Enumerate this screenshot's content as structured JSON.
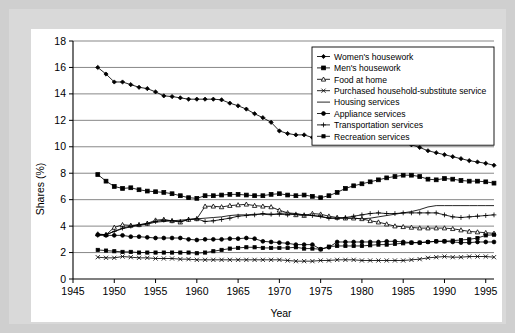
{
  "figure": {
    "background_color": "#cfcfcf",
    "mat_color": "#d9d9d9",
    "panel_color": "#ffffff"
  },
  "chart_data": {
    "type": "line",
    "title": "",
    "xlabel": "Year",
    "ylabel": "Shares (%)",
    "xlim": [
      1945,
      1996
    ],
    "ylim": [
      0,
      18
    ],
    "xticks": [
      1945,
      1950,
      1955,
      1960,
      1965,
      1970,
      1975,
      1980,
      1985,
      1990,
      1995
    ],
    "yticks": [
      0,
      2,
      4,
      6,
      8,
      10,
      12,
      14,
      16,
      18
    ],
    "grid": "horizontal",
    "legend_position": "top-right",
    "line_color": "#000000",
    "x": [
      1948,
      1949,
      1950,
      1951,
      1952,
      1953,
      1954,
      1955,
      1956,
      1957,
      1958,
      1959,
      1960,
      1961,
      1962,
      1963,
      1964,
      1965,
      1966,
      1967,
      1968,
      1969,
      1970,
      1971,
      1972,
      1973,
      1974,
      1975,
      1976,
      1977,
      1978,
      1979,
      1980,
      1981,
      1982,
      1983,
      1984,
      1985,
      1986,
      1987,
      1988,
      1989,
      1990,
      1991,
      1992,
      1993,
      1994,
      1995,
      1996
    ],
    "series": [
      {
        "name": "Women's housework",
        "marker": "filled-diamond",
        "values": [
          16.0,
          15.5,
          14.9,
          14.9,
          14.7,
          14.5,
          14.4,
          14.15,
          13.85,
          13.8,
          13.7,
          13.6,
          13.6,
          13.6,
          13.6,
          13.55,
          13.3,
          13.1,
          12.85,
          12.5,
          12.2,
          11.85,
          11.2,
          11.0,
          10.9,
          10.9,
          10.7,
          10.55,
          10.5,
          10.55,
          10.6,
          10.75,
          10.8,
          10.8,
          10.75,
          10.6,
          10.45,
          10.3,
          10.15,
          9.95,
          9.7,
          9.55,
          9.4,
          9.25,
          9.1,
          8.95,
          8.85,
          8.75,
          8.6
        ]
      },
      {
        "name": "Men's housework",
        "marker": "filled-square",
        "values": [
          7.9,
          7.4,
          7.0,
          6.85,
          6.9,
          6.75,
          6.65,
          6.6,
          6.55,
          6.45,
          6.3,
          6.15,
          6.1,
          6.3,
          6.3,
          6.35,
          6.4,
          6.4,
          6.35,
          6.3,
          6.3,
          6.4,
          6.45,
          6.35,
          6.3,
          6.35,
          6.25,
          6.15,
          6.3,
          6.55,
          6.85,
          7.05,
          7.2,
          7.35,
          7.5,
          7.65,
          7.75,
          7.85,
          7.85,
          7.75,
          7.55,
          7.5,
          7.6,
          7.55,
          7.45,
          7.4,
          7.4,
          7.35,
          7.25
        ]
      },
      {
        "name": "Food at home",
        "marker": "open-triangle",
        "values": [
          3.4,
          3.35,
          3.9,
          4.1,
          4.05,
          4.1,
          4.2,
          4.45,
          4.5,
          4.4,
          4.3,
          4.5,
          4.55,
          5.5,
          5.5,
          5.45,
          5.55,
          5.6,
          5.65,
          5.55,
          5.5,
          5.45,
          5.2,
          5.0,
          4.85,
          4.8,
          4.95,
          4.9,
          4.75,
          4.65,
          4.6,
          4.6,
          4.55,
          4.4,
          4.3,
          4.15,
          4.0,
          3.95,
          3.9,
          3.85,
          3.85,
          3.85,
          3.85,
          3.8,
          3.7,
          3.6,
          3.55,
          3.5,
          3.45
        ]
      },
      {
        "name": "Purchased household-substitute service",
        "marker": "cross-x",
        "values": [
          1.65,
          1.6,
          1.6,
          1.7,
          1.65,
          1.6,
          1.6,
          1.55,
          1.55,
          1.55,
          1.5,
          1.5,
          1.45,
          1.45,
          1.45,
          1.45,
          1.45,
          1.45,
          1.45,
          1.45,
          1.45,
          1.45,
          1.45,
          1.4,
          1.35,
          1.35,
          1.35,
          1.4,
          1.4,
          1.45,
          1.45,
          1.45,
          1.4,
          1.4,
          1.4,
          1.4,
          1.4,
          1.4,
          1.45,
          1.5,
          1.6,
          1.65,
          1.7,
          1.65,
          1.65,
          1.7,
          1.7,
          1.7,
          1.65
        ]
      },
      {
        "name": "Housing services",
        "marker": "line-only",
        "values": [
          3.35,
          3.35,
          3.6,
          3.8,
          3.95,
          4.05,
          4.15,
          4.3,
          4.35,
          4.4,
          4.45,
          4.5,
          4.55,
          4.6,
          4.65,
          4.7,
          4.8,
          4.85,
          4.85,
          4.9,
          4.9,
          4.85,
          4.95,
          5.0,
          4.95,
          4.85,
          4.8,
          4.7,
          4.6,
          4.6,
          4.6,
          4.6,
          4.55,
          4.6,
          4.7,
          4.8,
          4.9,
          5.0,
          5.1,
          5.25,
          5.45,
          5.55,
          5.55,
          5.55,
          5.55,
          5.55,
          5.55,
          5.55,
          5.55
        ]
      },
      {
        "name": "Appliance services",
        "marker": "filled-circle",
        "values": [
          3.35,
          3.3,
          3.3,
          3.3,
          3.2,
          3.2,
          3.15,
          3.1,
          3.1,
          3.1,
          3.1,
          3.0,
          2.95,
          3.0,
          3.0,
          3.0,
          3.05,
          3.05,
          3.1,
          3.05,
          2.85,
          2.8,
          2.75,
          2.7,
          2.6,
          2.6,
          2.6,
          2.25,
          2.4,
          2.8,
          2.8,
          2.8,
          2.8,
          2.8,
          2.8,
          2.85,
          2.85,
          2.8,
          2.75,
          2.75,
          2.8,
          2.85,
          2.85,
          2.8,
          2.75,
          2.75,
          2.8,
          2.8,
          2.8
        ]
      },
      {
        "name": "Transportation services",
        "marker": "plus",
        "values": [
          3.3,
          3.35,
          3.6,
          3.85,
          4.0,
          4.1,
          4.2,
          4.35,
          4.45,
          4.4,
          4.35,
          4.5,
          4.55,
          4.35,
          4.4,
          4.5,
          4.6,
          4.75,
          4.8,
          4.85,
          4.95,
          4.9,
          4.9,
          4.85,
          4.9,
          4.85,
          4.8,
          4.75,
          4.6,
          4.6,
          4.65,
          4.75,
          4.85,
          4.95,
          5.0,
          4.95,
          4.95,
          5.0,
          5.0,
          5.0,
          5.0,
          5.0,
          4.85,
          4.7,
          4.65,
          4.7,
          4.75,
          4.8,
          4.85
        ]
      },
      {
        "name": "Recreation services",
        "marker": "filled-square-small",
        "values": [
          2.2,
          2.15,
          2.1,
          2.05,
          2.05,
          2.0,
          2.0,
          2.0,
          2.0,
          2.0,
          2.0,
          2.0,
          1.95,
          2.0,
          2.1,
          2.2,
          2.3,
          2.35,
          2.4,
          2.4,
          2.35,
          2.35,
          2.35,
          2.35,
          2.4,
          2.3,
          2.3,
          2.25,
          2.45,
          2.5,
          2.5,
          2.5,
          2.5,
          2.55,
          2.6,
          2.6,
          2.65,
          2.7,
          2.75,
          2.75,
          2.8,
          2.85,
          2.85,
          2.9,
          2.95,
          3.0,
          3.1,
          3.3,
          3.35
        ]
      }
    ]
  }
}
